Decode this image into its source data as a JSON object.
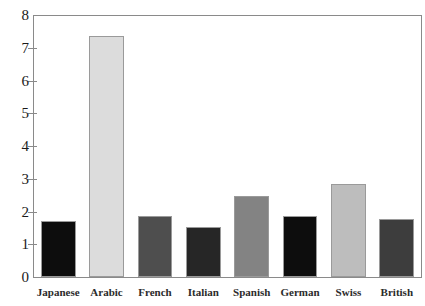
{
  "chart_data": {
    "type": "bar",
    "title": "",
    "subtitle": "",
    "xlabel": "",
    "ylabel": "",
    "categories": [
      "Japanese",
      "Arabic",
      "French",
      "Italian",
      "Spanish",
      "German",
      "Swiss",
      "British"
    ],
    "values": [
      1.7,
      7.35,
      1.86,
      1.52,
      2.48,
      1.85,
      2.84,
      1.77
    ],
    "bar_colors": [
      "#0d0d0d",
      "#dcdcdc",
      "#4e4e4e",
      "#262626",
      "#838383",
      "#0d0d0d",
      "#bdbdbd",
      "#3d3d3d"
    ],
    "ylim": [
      0,
      8
    ],
    "yticks": [
      0,
      1,
      2,
      3,
      4,
      5,
      6,
      7,
      8
    ],
    "ytick_labels": [
      "0",
      "1",
      "2",
      "3",
      "4",
      "5",
      "6",
      "7",
      "8"
    ],
    "grid": false,
    "legend": null,
    "legend_position": "none",
    "annotations": []
  },
  "style": {
    "axis_color": "#8a8a8a",
    "bar_border_color": "#9a9a9a",
    "background": "#ffffff",
    "tick_label_color": "#1a1a1a",
    "category_label_color": "#2b2b2b"
  }
}
